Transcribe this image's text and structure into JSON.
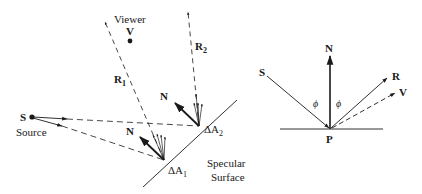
{
  "left_diagram": {
    "viewer_label": "Viewer",
    "viewer_point": "V",
    "source_point": "S",
    "source_label": "Source",
    "reflected_1": "R",
    "reflected_1_sub": "1",
    "reflected_2": "R",
    "reflected_2_sub": "2",
    "normal_1": "N",
    "normal_2": "N",
    "area_1": "ΔA",
    "area_1_sub": "1",
    "area_2": "ΔA",
    "area_2_sub": "2",
    "surface_label_line1": "Specular",
    "surface_label_line2": "Surface"
  },
  "right_diagram": {
    "normal": "N",
    "source": "S",
    "reflection": "R",
    "viewer": "V",
    "point": "P",
    "angle_incident": "ϕ",
    "angle_reflected": "ϕ"
  },
  "colors": {
    "ink": "#1a1a1a",
    "background": "#ffffff"
  }
}
